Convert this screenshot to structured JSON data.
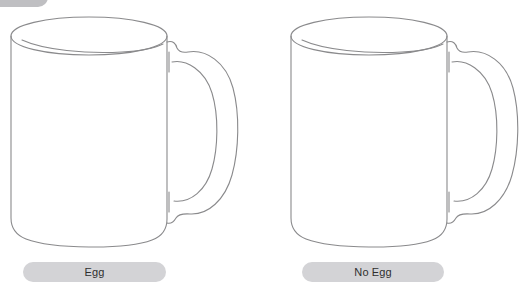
{
  "page": {
    "background_color": "#ffffff",
    "width": 526,
    "height": 293,
    "kind": "image-choice-comparison"
  },
  "top_partial_pill": {
    "name": "clipped-pill",
    "fill_color": "#bfbfc2",
    "label": ""
  },
  "options": [
    {
      "id": "egg",
      "label": "Egg",
      "illustration": "coffee-mug-line-drawing",
      "pill_fill_color": "#d3d3d6",
      "pill_text_color": "#2f2f2f",
      "outline_color": "#8a8a8c"
    },
    {
      "id": "no-egg",
      "label": "No Egg",
      "illustration": "coffee-mug-line-drawing",
      "pill_fill_color": "#d3d3d6",
      "pill_text_color": "#2f2f2f",
      "outline_color": "#8a8a8c"
    }
  ]
}
